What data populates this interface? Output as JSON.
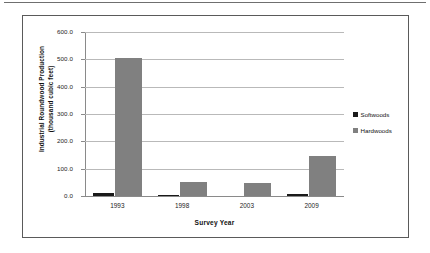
{
  "chart_data": {
    "type": "bar",
    "title": "",
    "xlabel": "Survey Year",
    "ylabel_line1": "Industrial Roundwood Production",
    "ylabel_line2": "(thousand cubic feet)",
    "categories": [
      "1993",
      "1998",
      "2003",
      "2009"
    ],
    "series": [
      {
        "name": "Softwoods",
        "color": "#1a1a1a",
        "values": [
          11,
          5,
          0,
          8
        ]
      },
      {
        "name": "Hardwoods",
        "color": "#808080",
        "values": [
          505,
          53,
          47,
          148
        ]
      }
    ],
    "ylim": [
      0,
      600
    ],
    "y_ticks": [
      "0.0",
      "100.0",
      "200.0",
      "300.0",
      "400.0",
      "500.0",
      "600.0"
    ],
    "y_tick_values": [
      0,
      100,
      200,
      300,
      400,
      500,
      600
    ],
    "grid": true,
    "legend_position": "right"
  },
  "legend": {
    "items": [
      {
        "label": "Softwoods",
        "color": "#1a1a1a"
      },
      {
        "label": "Hardwoods",
        "color": "#808080"
      }
    ]
  }
}
